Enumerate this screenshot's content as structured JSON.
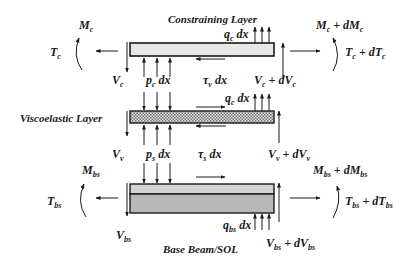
{
  "diagram": {
    "titles": {
      "constraining": "Constraining Layer",
      "viscoelastic": "Viscoelastic Layer",
      "base": "Base Beam/SOL"
    },
    "constraining_layer": {
      "fill": "#e8e8e8",
      "labels": {
        "moment_left": {
          "main": "M",
          "sub": "c"
        },
        "tension_left": {
          "main": "T",
          "sub": "c"
        },
        "moment_right": {
          "main": "M",
          "sub": "c",
          "plus": " + dM",
          "sub2": "c"
        },
        "tension_right": {
          "main": "T",
          "sub": "c",
          "plus": " + dT",
          "sub2": "c"
        },
        "shear_left": {
          "main": "V",
          "sub": "c"
        },
        "shear_right": {
          "main": "V",
          "sub": "c",
          "plus": " + dV",
          "sub2": "c"
        },
        "pressure": {
          "main": "p",
          "sub": "c",
          "tail": " dx"
        },
        "load": {
          "main": "q",
          "sub": "c",
          "tail": " dx"
        },
        "shear_stress": {
          "main": "τ",
          "sub": "v",
          "tail": " dx"
        }
      }
    },
    "viscoelastic_layer": {
      "fill": "#bdbdbd",
      "labels": {
        "shear_left": {
          "main": "V",
          "sub": "v"
        },
        "shear_right": {
          "main": "V",
          "sub": "v",
          "plus": " + dV",
          "sub2": "v"
        },
        "pressure": {
          "main": "p",
          "sub": "s",
          "tail": " dx"
        },
        "load": {
          "main": "q",
          "sub": "c",
          "tail": " dx"
        },
        "shear_stress": {
          "main": "τ",
          "sub": "s",
          "tail": " dx"
        }
      }
    },
    "base_beam": {
      "fill_top": "#d4d4d4",
      "fill_bottom": "#b8b8b8",
      "labels": {
        "moment_left": {
          "main": "M",
          "sub": "bs"
        },
        "tension_left": {
          "main": "T",
          "sub": "bs"
        },
        "moment_right": {
          "main": "M",
          "sub": "bs",
          "plus": " + dM",
          "sub2": "bs"
        },
        "tension_right": {
          "main": "T",
          "sub": "bs",
          "plus": " + dT",
          "sub2": "bs"
        },
        "shear_left": {
          "main": "V",
          "sub": "bs"
        },
        "shear_right": {
          "main": "V",
          "sub": "bs",
          "plus": " + dV",
          "sub2": "bs"
        },
        "load": {
          "main": "q",
          "sub": "bs",
          "tail": " dx"
        }
      }
    },
    "stroke_color": "#1a1a1a"
  }
}
